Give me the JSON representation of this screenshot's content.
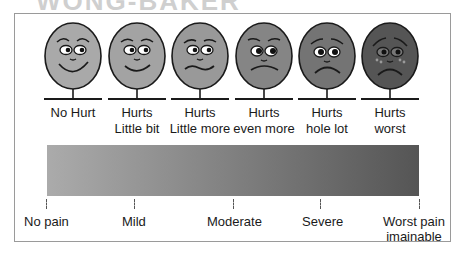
{
  "title_fragment": "WONG-BAKER",
  "faces": [
    {
      "label_line1": "No Hurt",
      "label_line2": "",
      "fill": "#a9a9a9",
      "mood": "big-smile"
    },
    {
      "label_line1": "Hurts",
      "label_line2": "Little bit",
      "fill": "#a3a3a3",
      "mood": "smile"
    },
    {
      "label_line1": "Hurts",
      "label_line2": "Little more",
      "fill": "#999999",
      "mood": "wavy"
    },
    {
      "label_line1": "Hurts",
      "label_line2": "even more",
      "fill": "#858585",
      "mood": "frown"
    },
    {
      "label_line1": "Hurts",
      "label_line2": "hole lot",
      "fill": "#747474",
      "mood": "sad"
    },
    {
      "label_line1": "Hurts",
      "label_line2": "worst",
      "fill": "#555555",
      "mood": "crying"
    }
  ],
  "gradient": {
    "start": "#ababab",
    "end": "#555555"
  },
  "scale": [
    {
      "label": "No pain"
    },
    {
      "label": "Mild"
    },
    {
      "label": "Moderate"
    },
    {
      "label": "Severe"
    },
    {
      "label": "Worst pain",
      "label2": "imainable"
    }
  ]
}
